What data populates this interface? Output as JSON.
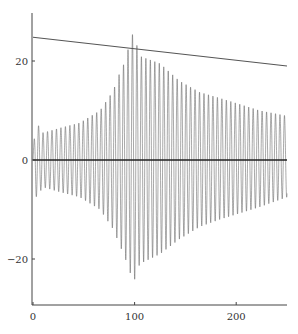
{
  "chart_data": {
    "type": "line",
    "title": "",
    "xlabel": "",
    "ylabel": "",
    "xlim": [
      0,
      250
    ],
    "ylim": [
      -30,
      30
    ],
    "grid": false,
    "legend": null,
    "x_ticks": [
      0,
      100,
      200
    ],
    "x_tick_labels": [
      "0",
      "100",
      "200"
    ],
    "y_ticks": [
      -20,
      0,
      20
    ],
    "y_tick_labels": [
      "−20",
      "0",
      "20"
    ],
    "series": [
      {
        "name": "oscillating signal",
        "style": "dense oscillation (~57 cycles over 0-250), gray",
        "period": 4.4,
        "envelope_upper": {
          "x": [
            0,
            3,
            10,
            27,
            46,
            66,
            79,
            86,
            91,
            97,
            100,
            105,
            125,
            144,
            164,
            184,
            203,
            223,
            250
          ],
          "y": [
            2,
            7.7,
            5.5,
            6.5,
            7.5,
            10,
            14,
            18,
            20,
            25.5,
            25,
            21,
            19.5,
            16,
            13.7,
            12.5,
            11.3,
            10,
            8.9
          ]
        },
        "envelope_lower": {
          "x": [
            0,
            3,
            10,
            27,
            46,
            66,
            79,
            86,
            91,
            99,
            105,
            125,
            144,
            164,
            184,
            203,
            223,
            250
          ],
          "y": [
            -2,
            -7.5,
            -5.5,
            -6.5,
            -7.5,
            -10,
            -14,
            -17.5,
            -20,
            -24.8,
            -21,
            -19,
            -16,
            -13.5,
            -12,
            -10.8,
            -9.5,
            -7.5
          ]
        }
      },
      {
        "name": "upper reference line",
        "style": "straight line",
        "x": [
          0,
          250
        ],
        "y": [
          24.8,
          19
        ]
      },
      {
        "name": "zero line",
        "style": "horizontal line",
        "x": [
          0,
          250
        ],
        "y": [
          0,
          0
        ]
      }
    ]
  },
  "colors": {
    "signal": "#555555",
    "reference_line": "#555555",
    "zero_line": "#222222",
    "axis": "#444444"
  }
}
